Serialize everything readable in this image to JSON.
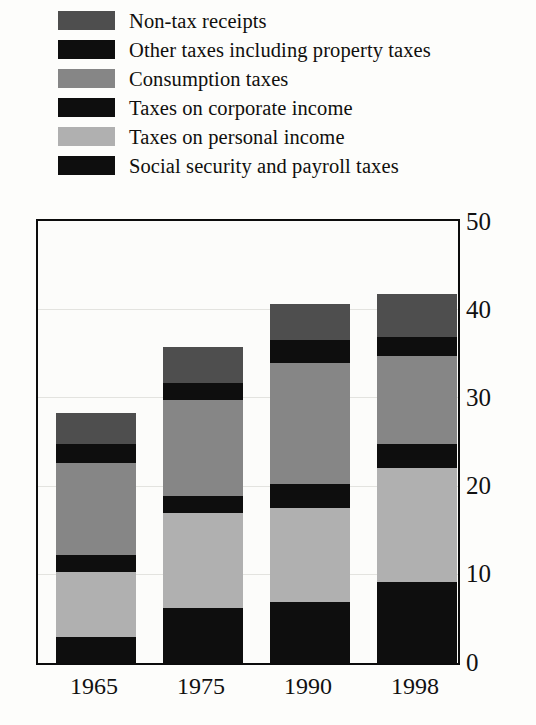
{
  "chart_data": {
    "type": "bar",
    "variant": "stacked-vertical",
    "title": "",
    "subtitle": "",
    "xlabel": "",
    "ylabel": "",
    "categories": [
      "1965",
      "1975",
      "1990",
      "1998"
    ],
    "ylim": [
      0,
      50
    ],
    "ytick_values": [
      0,
      10,
      20,
      30,
      40,
      50
    ],
    "ytick_labels": [
      "0",
      "10",
      "20",
      "30",
      "40",
      "50"
    ],
    "grid": true,
    "grid_axis": "y",
    "legend_position": "above-plot",
    "stack_order_bottom_to_top": [
      "Social security and payroll taxes",
      "Taxes on personal income",
      "Taxes on corporate income",
      "Consumption taxes",
      "Other taxes including property taxes",
      "Non-tax receipts"
    ],
    "series": [
      {
        "name": "Social security and payroll taxes",
        "color": "#0e0e0e",
        "values": [
          2.9,
          6.2,
          6.9,
          9.2
        ]
      },
      {
        "name": "Taxes on personal income",
        "color": "#b0b0b0",
        "values": [
          7.4,
          10.8,
          10.7,
          12.9
        ]
      },
      {
        "name": "Taxes on corporate income",
        "color": "#0e0e0e",
        "values": [
          2.0,
          1.9,
          2.7,
          2.7
        ]
      },
      {
        "name": "Consumption taxes",
        "color": "#868686",
        "values": [
          10.4,
          10.9,
          13.7,
          10.0
        ]
      },
      {
        "name": "Other taxes including property taxes",
        "color": "#0e0e0e",
        "values": [
          2.1,
          1.9,
          2.6,
          2.2
        ]
      },
      {
        "name": "Non-tax receipts",
        "color": "#4e4e4e",
        "values": [
          3.6,
          4.1,
          4.1,
          4.8
        ]
      }
    ],
    "totals": [
      28.4,
      35.8,
      40.7,
      41.8
    ]
  },
  "legend": {
    "items": [
      {
        "label": "Non-tax receipts",
        "color": "#4e4e4e"
      },
      {
        "label": "Other taxes including property taxes",
        "color": "#0e0e0e"
      },
      {
        "label": "Consumption taxes",
        "color": "#868686"
      },
      {
        "label": "Taxes on corporate income",
        "color": "#0e0e0e"
      },
      {
        "label": "Taxes on personal income",
        "color": "#b0b0b0"
      },
      {
        "label": "Social security and payroll taxes",
        "color": "#0e0e0e"
      }
    ]
  },
  "axes": {
    "y_labels": [
      "50",
      "40",
      "30",
      "20",
      "10",
      "0"
    ],
    "x_labels": [
      "1965",
      "1975",
      "1990",
      "1998"
    ]
  },
  "colors": {
    "frame": "#0c0c0c",
    "grid": "#e3e3df",
    "background": "#fdfdfb",
    "text": "#111111"
  }
}
